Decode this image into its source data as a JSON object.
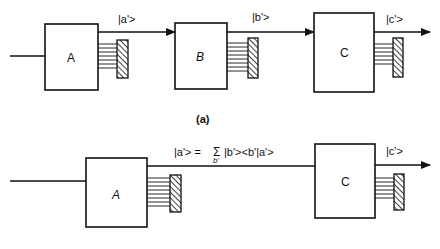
{
  "diagram": {
    "panel_a": {
      "caption": "(a)",
      "boxes": [
        {
          "id": "A",
          "label": "A",
          "italic": false
        },
        {
          "id": "B",
          "label": "B",
          "italic": true
        },
        {
          "id": "C",
          "label": "C",
          "italic": false
        }
      ],
      "arrows": [
        {
          "from": "A",
          "to": "B",
          "label": "|a'>"
        },
        {
          "from": "B",
          "to": "C",
          "label": "|b'>"
        },
        {
          "from": "C",
          "to": "out",
          "label": "|c'>"
        }
      ]
    },
    "panel_b": {
      "caption": "(b)",
      "boxes": [
        {
          "id": "A",
          "label": "A",
          "italic": true
        },
        {
          "id": "C",
          "label": "C",
          "italic": false
        }
      ],
      "arrows": [
        {
          "from": "A",
          "to": "C",
          "label_lhs": "|a'> = ",
          "sigma": "Σ",
          "sigma_sub": "b'",
          "label_rhs": "|b'><b'|a'>"
        },
        {
          "from": "C",
          "to": "out",
          "label": "|c'>"
        }
      ]
    },
    "colors": {
      "stroke": "#111111",
      "background": "#ffffff"
    }
  }
}
